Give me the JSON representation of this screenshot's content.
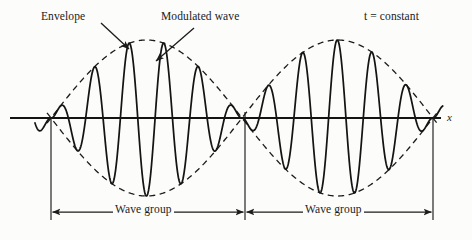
{
  "figure": {
    "width": 472,
    "height": 240,
    "background_color": "#fcfcfa",
    "ink_color": "#1b1b1b"
  },
  "labels": {
    "envelope": "Envelope",
    "modulated_wave": "Modulated wave",
    "t_constant": "t = constant",
    "axis_x": "x",
    "wave_group_1": "Wave group",
    "wave_group_2": "Wave group"
  },
  "annotations": [
    {
      "name": "envelope-leader",
      "text": "Envelope",
      "from": [
        101,
        23
      ],
      "to": [
        129,
        49
      ]
    },
    {
      "name": "modulated-wave-leader",
      "text": "Modulated wave",
      "from": [
        194,
        28
      ],
      "to": [
        156,
        61
      ]
    }
  ],
  "axis": {
    "name": "x-axis",
    "y": 118,
    "x_start": 10,
    "x_end": 441,
    "label": "x",
    "label_position": [
      447,
      118
    ]
  },
  "chart_data": {
    "type": "line",
    "xlabel": "x",
    "ylabel": "",
    "grid": false,
    "legend": false,
    "axis_y_pixel": 118,
    "x_domain_pixels": [
      51,
      433
    ],
    "node_positions_px": [
      51,
      245,
      433
    ],
    "envelope": {
      "name": "Envelope",
      "style": "dashed",
      "type": "cosine-modulation",
      "amplitude_px": 78,
      "group_wavelength_px": 382,
      "description": "Upper envelope = +A|sin(pi*(x-51)/191)|, lower envelope = -A|sin(pi*(x-51)/191)|",
      "max_amplitude_positions_px": [
        146,
        339
      ],
      "zero_positions_px": [
        51,
        245,
        433
      ]
    },
    "carrier": {
      "name": "Modulated wave",
      "style": "solid",
      "cycles_per_group": 5.5,
      "carrier_wavelength_px": 34.7,
      "description": "Carrier sin wave multiplied by the envelope amplitude"
    },
    "series": [
      {
        "name": "Upper envelope",
        "style": "dashed",
        "x": [
          51,
          75,
          99,
          122,
          146,
          170,
          194,
          218,
          245,
          269,
          292,
          316,
          339,
          363,
          387,
          410,
          433
        ],
        "y": [
          0,
          30,
          55,
          72,
          78,
          72,
          55,
          30,
          0,
          30,
          55,
          72,
          78,
          72,
          55,
          30,
          0
        ]
      },
      {
        "name": "Lower envelope",
        "style": "dashed",
        "x": [
          51,
          75,
          99,
          122,
          146,
          170,
          194,
          218,
          245,
          269,
          292,
          316,
          339,
          363,
          387,
          410,
          433
        ],
        "y": [
          0,
          -30,
          -55,
          -72,
          -78,
          -72,
          -55,
          -30,
          0,
          -30,
          -55,
          -72,
          -78,
          -72,
          -55,
          -30,
          0
        ]
      },
      {
        "name": "Modulated wave (carrier)",
        "style": "solid",
        "description": "A(x)*sin(2*pi*(x-51)/34.7) where A(x) is the envelope"
      }
    ]
  },
  "measure_bars": [
    {
      "name": "wave-group-1-measure",
      "label": "Wave group",
      "x_start": 51,
      "x_end": 245,
      "y": 212,
      "arrow_both_ends": true
    },
    {
      "name": "wave-group-2-measure",
      "label": "Wave group",
      "x_start": 245,
      "x_end": 433,
      "y": 212,
      "arrow_both_ends": true
    }
  ],
  "drop_lines": [
    {
      "name": "drop-line-left",
      "x": 51,
      "y_top": 118,
      "y_bottom": 220
    },
    {
      "name": "drop-line-center",
      "x": 245,
      "y_top": 112,
      "y_bottom": 220
    },
    {
      "name": "drop-line-right",
      "x": 433,
      "y_top": 118,
      "y_bottom": 220
    }
  ]
}
